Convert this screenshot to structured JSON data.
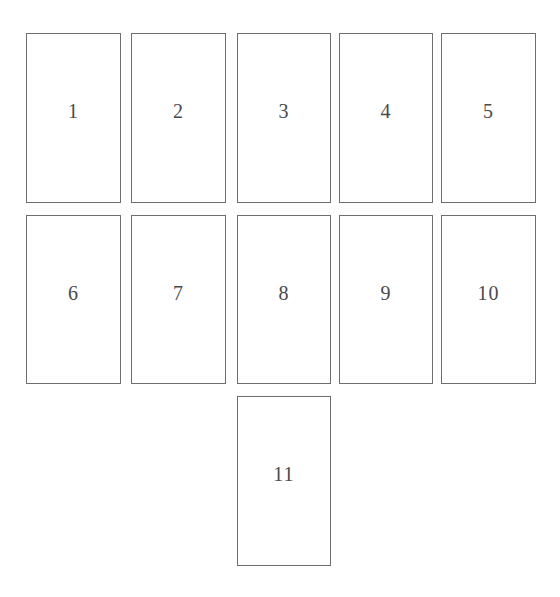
{
  "diagram": {
    "border_color": "#6e6e6e",
    "text_color": "#4a4a4a",
    "cards": [
      {
        "label": "1",
        "x": 26,
        "y": 33,
        "w": 95,
        "h": 170
      },
      {
        "label": "2",
        "x": 131,
        "y": 33,
        "w": 95,
        "h": 170
      },
      {
        "label": "3",
        "x": 237,
        "y": 33,
        "w": 94,
        "h": 170
      },
      {
        "label": "4",
        "x": 339,
        "y": 33,
        "w": 94,
        "h": 170
      },
      {
        "label": "5",
        "x": 441,
        "y": 33,
        "w": 95,
        "h": 170
      },
      {
        "label": "6",
        "x": 26,
        "y": 215,
        "w": 95,
        "h": 169
      },
      {
        "label": "7",
        "x": 131,
        "y": 215,
        "w": 95,
        "h": 169
      },
      {
        "label": "8",
        "x": 237,
        "y": 215,
        "w": 94,
        "h": 169
      },
      {
        "label": "9",
        "x": 339,
        "y": 215,
        "w": 94,
        "h": 169
      },
      {
        "label": "10",
        "x": 441,
        "y": 215,
        "w": 95,
        "h": 169
      },
      {
        "label": "11",
        "x": 237,
        "y": 396,
        "w": 94,
        "h": 170
      }
    ]
  }
}
